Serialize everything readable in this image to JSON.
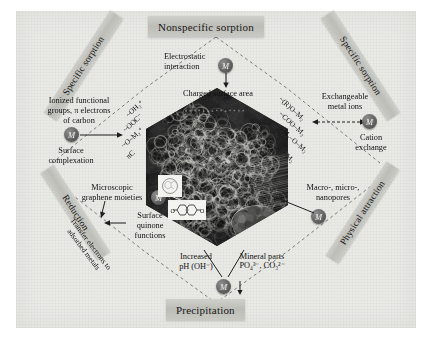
{
  "figure": {
    "title_top": "Nonspecific sorption",
    "title_bottom": "Precipitation",
    "banners": {
      "left_top": "Specific sorption",
      "left_bottom": "Reduction",
      "right_top": "Specific sorption",
      "right_bottom": "Physical attraction"
    },
    "center": {
      "caption": "Charged surface area",
      "description": "SEM micrograph of porous biochar surface"
    },
    "labels": {
      "electrostatic_interaction": "Electrostatic\ninteraction",
      "ionized_functional_groups": "Ionized functional\ngroups, π electrons\nof carbon",
      "surface_complexation": "Surface\ncomplexation",
      "exchangeable_metal_ions": "Exchangeable\nmetal ions",
      "cation_exchange": "Cation\nexchange",
      "macro_micro_nanopores": "Macro-, micro-,\nnanopores",
      "mineral_parts": "Mineral parts",
      "mineral_formula": "PO₄³⁻, CO₃²⁻",
      "increased_ph": "Increased\npH (OH⁻)",
      "microscopic_graphene": "Microscopic\ngraphene moieties",
      "surface_quinone": "Surface\nquinone\nfunctions",
      "transfer_electrons": "Transfer electrons to\nadsorbed metals"
    },
    "metal_ion_symbol": "M",
    "formulas_left": [
      "~OH₂⁺",
      "~OOC⁻",
      "~O–M₂⁺",
      "πC"
    ],
    "formulas_right": [
      "~(R)O–M₂",
      "~COO–M₂",
      "~M₂–O–M₂",
      "~M₂"
    ],
    "colors": {
      "paper": "#e9e9e6",
      "ribbon": "#c4c4bf",
      "metal_ion": "#5e5e5e",
      "text": "#111111",
      "micrograph": "#2b2b2b"
    }
  }
}
